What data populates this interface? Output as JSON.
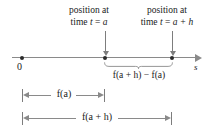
{
  "figure": {
    "width": 211,
    "height": 137,
    "background": "#ffffff",
    "line_color": "#8a8a8a",
    "text_color": "#1a1a1a",
    "dot_color": "#2b2b2b"
  },
  "callouts": {
    "left": {
      "line1": "position at",
      "line2_prefix": "time ",
      "line2_var": "t",
      "line2_eq": " = ",
      "line2_value": "a"
    },
    "right": {
      "line1": "position at",
      "line2_prefix": "time ",
      "line2_var": "t",
      "line2_eq": " = ",
      "line2_value": "a + h"
    }
  },
  "axis": {
    "origin_label": "0",
    "axis_variable": "s"
  },
  "brace": {
    "label": "f(a + h) − f(a)"
  },
  "measurements": [
    {
      "label": "f(a)"
    },
    {
      "label": "f(a + h)"
    }
  ]
}
